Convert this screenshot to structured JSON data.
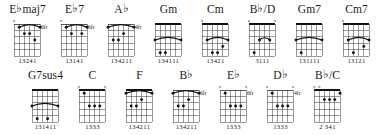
{
  "chart_title": "Guitar chord chart",
  "layout": {
    "rows": 2,
    "string_count": 6,
    "fret_count": 5
  },
  "symbols": {
    "muted": "x",
    "flat": "♭",
    "fret_suffix": "fr"
  },
  "rows": [
    {
      "row_index": 0,
      "chords": [
        {
          "name_root": "E",
          "name_flat": "♭",
          "name_suffix": "maj7",
          "name_full": "E♭maj7",
          "fret_label": "6fr",
          "fingering": "13241",
          "muted_strings": [
            6
          ],
          "open_strings": [],
          "barre": {
            "fret": 1,
            "from_string": 5,
            "to_string": 1
          },
          "dots": [
            {
              "string": 4,
              "fret": 2
            },
            {
              "string": 3,
              "fret": 2
            },
            {
              "string": 2,
              "fret": 3
            }
          ]
        },
        {
          "name_root": "E",
          "name_flat": "♭",
          "name_suffix": "7",
          "name_full": "E♭7",
          "fret_label": "6fr",
          "fingering": "13141",
          "muted_strings": [
            6
          ],
          "open_strings": [],
          "barre": {
            "fret": 1,
            "from_string": 5,
            "to_string": 1
          },
          "dots": [
            {
              "string": 4,
              "fret": 2
            },
            {
              "string": 2,
              "fret": 2
            }
          ]
        },
        {
          "name_root": "A",
          "name_flat": "♭",
          "name_suffix": "",
          "name_full": "A♭",
          "fret_label": "4fr",
          "fingering": "134211",
          "muted_strings": [],
          "open_strings": [],
          "barre": {
            "fret": 1,
            "from_string": 6,
            "to_string": 1
          },
          "dots": [
            {
              "string": 5,
              "fret": 3
            },
            {
              "string": 4,
              "fret": 3
            },
            {
              "string": 3,
              "fret": 2
            }
          ]
        },
        {
          "name_root": "G",
          "name_flat": "",
          "name_suffix": "m",
          "name_full": "Gm",
          "fret_label": "",
          "fingering": "134111",
          "muted_strings": [],
          "open_strings": [],
          "barre": {
            "fret": 3,
            "from_string": 6,
            "to_string": 1
          },
          "dots": [
            {
              "string": 5,
              "fret": 5
            },
            {
              "string": 4,
              "fret": 5
            }
          ]
        },
        {
          "name_root": "C",
          "name_flat": "",
          "name_suffix": "m",
          "name_full": "Cm",
          "fret_label": "",
          "fingering": "13421",
          "muted_strings": [
            6
          ],
          "open_strings": [],
          "barre": {
            "fret": 3,
            "from_string": 5,
            "to_string": 1
          },
          "dots": [
            {
              "string": 4,
              "fret": 5
            },
            {
              "string": 3,
              "fret": 5
            },
            {
              "string": 2,
              "fret": 4
            }
          ]
        },
        {
          "name_root": "B",
          "name_flat": "♭",
          "name_suffix": "/D",
          "name_full": "B♭/D",
          "fret_label": "",
          "fingering": "3111",
          "muted_strings": [
            6,
            1
          ],
          "open_strings": [],
          "barre": {
            "fret": 3,
            "from_string": 4,
            "to_string": 2
          },
          "dots": [
            {
              "string": 5,
              "fret": 5
            }
          ]
        },
        {
          "name_root": "G",
          "name_flat": "",
          "name_suffix": "m7",
          "name_full": "Gm7",
          "fret_label": "",
          "fingering": "131111",
          "muted_strings": [],
          "open_strings": [],
          "barre": {
            "fret": 3,
            "from_string": 6,
            "to_string": 1
          },
          "dots": [
            {
              "string": 5,
              "fret": 5
            }
          ]
        },
        {
          "name_root": "C",
          "name_flat": "",
          "name_suffix": "m7",
          "name_full": "Cm7",
          "fret_label": "",
          "fingering": "13121",
          "muted_strings": [
            6
          ],
          "open_strings": [],
          "barre": {
            "fret": 3,
            "from_string": 5,
            "to_string": 1
          },
          "dots": [
            {
              "string": 4,
              "fret": 5
            },
            {
              "string": 2,
              "fret": 4
            }
          ]
        }
      ]
    },
    {
      "row_index": 1,
      "chords": [
        {
          "name_root": "G",
          "name_flat": "",
          "name_suffix": "7sus4",
          "name_full": "G7sus4",
          "fret_label": "",
          "fingering": "131411",
          "muted_strings": [],
          "open_strings": [],
          "barre": {
            "fret": 3,
            "from_string": 6,
            "to_string": 1
          },
          "dots": [
            {
              "string": 5,
              "fret": 5
            },
            {
              "string": 3,
              "fret": 5
            }
          ]
        },
        {
          "name_root": "C",
          "name_flat": "",
          "name_suffix": "",
          "name_full": "C",
          "fret_label": "",
          "fingering": "1333",
          "muted_strings": [
            6,
            1
          ],
          "open_strings": [],
          "barre": {
            "fret": 1,
            "from_string": 5,
            "to_string": 5
          },
          "dots": [
            {
              "string": 4,
              "fret": 3
            },
            {
              "string": 3,
              "fret": 3
            },
            {
              "string": 2,
              "fret": 3
            }
          ]
        },
        {
          "name_root": "F",
          "name_flat": "",
          "name_suffix": "",
          "name_full": "F",
          "fret_label": "",
          "fingering": "134211",
          "muted_strings": [],
          "open_strings": [],
          "barre": {
            "fret": 1,
            "from_string": 6,
            "to_string": 1
          },
          "dots": [
            {
              "string": 5,
              "fret": 3
            },
            {
              "string": 4,
              "fret": 3
            },
            {
              "string": 3,
              "fret": 2
            }
          ]
        },
        {
          "name_root": "B",
          "name_flat": "♭",
          "name_suffix": "",
          "name_full": "B♭",
          "fret_label": "6fr",
          "fingering": "134211",
          "muted_strings": [],
          "open_strings": [],
          "barre": {
            "fret": 1,
            "from_string": 6,
            "to_string": 1
          },
          "dots": [
            {
              "string": 5,
              "fret": 3
            },
            {
              "string": 4,
              "fret": 3
            },
            {
              "string": 3,
              "fret": 2
            }
          ]
        },
        {
          "name_root": "E",
          "name_flat": "♭",
          "name_suffix": "",
          "name_full": "E♭",
          "fret_label": "6fr",
          "fingering": "1333",
          "muted_strings": [
            6,
            1
          ],
          "open_strings": [],
          "barre": {
            "fret": 1,
            "from_string": 5,
            "to_string": 5
          },
          "dots": [
            {
              "string": 4,
              "fret": 3
            },
            {
              "string": 3,
              "fret": 3
            },
            {
              "string": 2,
              "fret": 3
            }
          ]
        },
        {
          "name_root": "D",
          "name_flat": "♭",
          "name_suffix": "",
          "name_full": "D♭",
          "fret_label": "4fr",
          "fingering": "1333",
          "muted_strings": [
            6,
            1
          ],
          "open_strings": [],
          "barre": {
            "fret": 1,
            "from_string": 5,
            "to_string": 5
          },
          "dots": [
            {
              "string": 4,
              "fret": 3
            },
            {
              "string": 3,
              "fret": 3
            },
            {
              "string": 2,
              "fret": 3
            }
          ]
        },
        {
          "name_root": "B",
          "name_flat": "♭",
          "name_suffix": "/C",
          "name_full": "B♭/C",
          "fret_label": "",
          "fingering": "2 341",
          "muted_strings": [
            6,
            5
          ],
          "open_strings": [],
          "barre": {
            "fret": 1,
            "from_string": 1,
            "to_string": 1
          },
          "dots": [
            {
              "string": 4,
              "fret": 2
            },
            {
              "string": 3,
              "fret": 2
            },
            {
              "string": 2,
              "fret": 2
            }
          ]
        }
      ]
    }
  ]
}
